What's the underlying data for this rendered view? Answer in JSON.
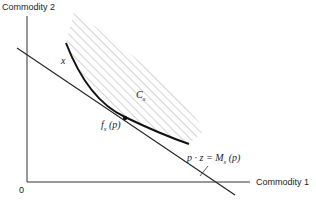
{
  "axes": {
    "y_label": "Commodity 2",
    "x_label": "Commodity 1",
    "origin": "0"
  },
  "labels": {
    "curve": "x",
    "set_main": "C",
    "set_sub": "x",
    "point_main": "f",
    "point_sub": "x",
    "point_arg": "(p)",
    "budget_lhs": "p · z = M",
    "budget_sub": "x",
    "budget_arg": "(p)"
  },
  "colors": {
    "ink": "#222222",
    "hatch": "#aaaaaa"
  }
}
